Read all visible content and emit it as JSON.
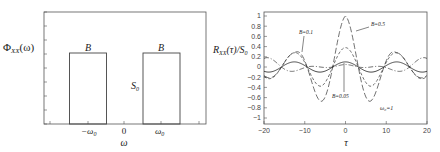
{
  "chart_data": [
    {
      "type": "line",
      "title": "",
      "ylabel": "Φ_XX(ω)",
      "xlabel": "ω",
      "x_tick_labels": [
        "-ω0",
        "0",
        "ω0"
      ],
      "annotations": [
        {
          "text": "B",
          "position": "above left band"
        },
        {
          "text": "B",
          "position": "above right band"
        },
        {
          "text": "S0",
          "position": "height of right band"
        }
      ],
      "bands": [
        {
          "center": "-ω0",
          "width": "B",
          "height": "S0"
        },
        {
          "center": "ω0",
          "width": "B",
          "height": "S0"
        }
      ],
      "grid": false
    },
    {
      "type": "line",
      "title": "",
      "ylabel": "R_XX(τ)/S0",
      "xlabel": "τ",
      "xlim": [
        -20,
        20
      ],
      "ylim": [
        -1.1,
        1.1
      ],
      "x_ticks": [
        -20,
        -10,
        0,
        10,
        20
      ],
      "y_ticks": [
        1,
        0.8,
        0.6,
        0.4,
        0.2,
        0,
        -0.2,
        -0.4,
        -0.6,
        -0.8,
        -1
      ],
      "grid": false,
      "annotations": [
        {
          "text": "B=0.5",
          "points_to_tau": 2.5,
          "points_to_value": 0.8
        },
        {
          "text": "B=0.1",
          "points_to_tau": -12,
          "points_to_value": 0.28
        },
        {
          "text": "B=0.05",
          "points_to_tau": -1,
          "points_to_value": 0.1
        },
        {
          "text": "ω0=1",
          "position": "lower right"
        }
      ],
      "series": [
        {
          "name": "B=0.5",
          "style": "long-dash",
          "envelope": [
            [
              0,
              1.0
            ],
            [
              6,
              0.68
            ],
            [
              12.5,
              0.28
            ],
            [
              20,
              0.2
            ]
          ],
          "carrier": 0.5
        },
        {
          "name": "B=0.1",
          "style": "short-dash",
          "envelope": [
            [
              0,
              0.38
            ],
            [
              6,
              0.38
            ],
            [
              12.5,
              0.28
            ],
            [
              20,
              0.22
            ]
          ],
          "carrier": 0.5
        },
        {
          "name": "B=0.05",
          "style": "solid",
          "envelope": [
            [
              0,
              0.1
            ],
            [
              20,
              0.1
            ]
          ],
          "carrier": 0.5
        },
        {
          "name": "other",
          "style": "dash-dot",
          "envelope": [
            [
              0,
              0.0
            ],
            [
              6,
              0.06
            ],
            [
              12.5,
              0.08
            ],
            [
              20,
              -0.2
            ]
          ],
          "carrier": 0.5
        }
      ]
    }
  ],
  "left": {
    "ylabel": "Φ",
    "ylabel_sub": "XX",
    "ylabel_arg": "(ω)",
    "band_label_left": "B",
    "band_label_right": "B",
    "height_label": "S",
    "height_label_sub": "0",
    "xtick_neg": "−ω",
    "xtick_neg_sub": "0",
    "xtick_zero": "0",
    "xtick_pos": "ω",
    "xtick_pos_sub": "0",
    "xlabel": "ω"
  },
  "right": {
    "ylabel_R": "R",
    "ylabel_sub": "XX",
    "ylabel_mid": "(τ)/S",
    "ylabel_sub2": "0",
    "xlabel": "τ",
    "label_b05": "B=0.5",
    "label_b01": "B=0.1",
    "label_b005": "B=0.05",
    "label_w0": "ω₀=1"
  }
}
